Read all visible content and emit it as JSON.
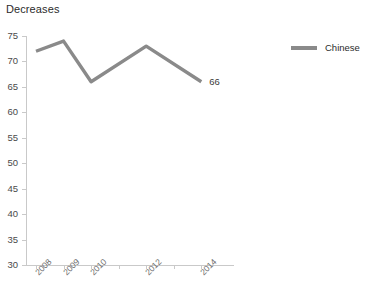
{
  "chart_data": {
    "type": "line",
    "title": "Decreases",
    "xlabel": "",
    "ylabel": "",
    "categories": [
      "2008",
      "2009",
      "2010",
      "2011",
      "2012",
      "2013",
      "2014"
    ],
    "tick_labels_visible": [
      "2008",
      "2009",
      "2010",
      "",
      "2012",
      "",
      "2014"
    ],
    "series": [
      {
        "name": "Chinese",
        "color": "#8a8a8a",
        "x": [
          "2008",
          "2009",
          "2010",
          "2012",
          "2014"
        ],
        "values": [
          72,
          74,
          66,
          73,
          66
        ]
      }
    ],
    "point_labels": [
      {
        "category": "2014",
        "value": "66"
      }
    ],
    "ylim": [
      30,
      75
    ],
    "yticks": [
      75,
      70,
      65,
      60,
      55,
      50,
      45,
      40,
      35,
      30
    ],
    "grid": false,
    "legend": {
      "position": "right",
      "entries": [
        {
          "label": "Chinese",
          "color": "#8a8a8a"
        }
      ]
    },
    "axis_color": "#c9c9c9"
  }
}
